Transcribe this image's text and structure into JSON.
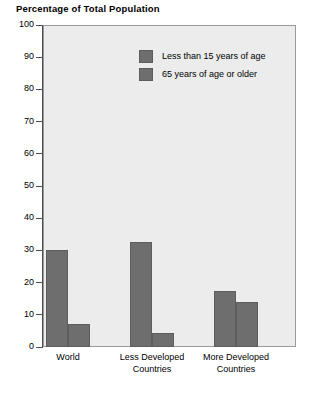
{
  "chart_data": {
    "type": "bar",
    "title": "Percentage of Total Population",
    "xlabel": "",
    "ylabel": "",
    "ylim": [
      0,
      100
    ],
    "yticks": [
      0,
      10,
      20,
      30,
      40,
      50,
      60,
      70,
      80,
      90,
      100
    ],
    "ytick_labels": [
      "0",
      "10",
      "20",
      "30",
      "40",
      "50",
      "60",
      "70",
      "80",
      "90",
      "100"
    ],
    "grid": false,
    "legend_position": "inside-top-center",
    "categories": [
      "World",
      "Less Developed\nCountries",
      "More Developed\nCountries"
    ],
    "series": [
      {
        "name": "Less than 15 years of age",
        "color": "#6e6e6e",
        "values": [
          30,
          32.5,
          17.5
        ]
      },
      {
        "name": "65 years of age or older",
        "color": "#6e6e6e",
        "values": [
          7,
          4.5,
          14
        ]
      }
    ],
    "plot_background": "#ececec",
    "axis_color": "#4d4d4d"
  }
}
